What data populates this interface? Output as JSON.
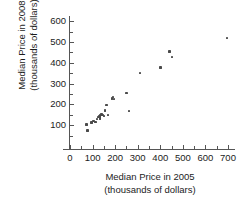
{
  "chart_data": {
    "type": "scatter",
    "title": "",
    "xlabel": "Median Price in 2005 (thousands of dollars)",
    "ylabel": "Median Price in 2008 (thousands of dollars)",
    "xlabel_line1": "Median Price in 2005",
    "xlabel_line2": "(thousands of dollars)",
    "ylabel_line1": "Median Price in 2008",
    "ylabel_line2": "(thousands of dollars)",
    "xlim": [
      0,
      720
    ],
    "ylim": [
      0,
      640
    ],
    "grid": false,
    "legend": null,
    "x_major_ticks": [
      0,
      100,
      200,
      300,
      400,
      500,
      600,
      700
    ],
    "x_tick_labels": [
      "0",
      "100",
      "200",
      "300",
      "400",
      "500",
      "600",
      "700"
    ],
    "x_minor_ticks": [
      50,
      150,
      250,
      350,
      450,
      550,
      650
    ],
    "y_major_ticks": [
      100,
      200,
      300,
      400,
      500,
      600
    ],
    "y_tick_labels": [
      "100",
      "200",
      "300",
      "400",
      "500",
      "600"
    ],
    "y_minor_ticks": [
      50,
      150,
      250,
      350,
      450,
      550
    ],
    "marker": "square",
    "marker_color": "#4a4a4a",
    "axis_color": "#555555",
    "points": [
      {
        "x": 72,
        "y": 103
      },
      {
        "x": 78,
        "y": 74
      },
      {
        "x": 96,
        "y": 112
      },
      {
        "x": 104,
        "y": 120
      },
      {
        "x": 112,
        "y": 115
      },
      {
        "x": 120,
        "y": 130
      },
      {
        "x": 126,
        "y": 140
      },
      {
        "x": 130,
        "y": 143
      },
      {
        "x": 132,
        "y": 150
      },
      {
        "x": 134,
        "y": 133
      },
      {
        "x": 140,
        "y": 152
      },
      {
        "x": 146,
        "y": 148
      },
      {
        "x": 150,
        "y": 145
      },
      {
        "x": 156,
        "y": 170
      },
      {
        "x": 162,
        "y": 198
      },
      {
        "x": 168,
        "y": 150
      },
      {
        "x": 186,
        "y": 228
      },
      {
        "x": 190,
        "y": 236
      },
      {
        "x": 196,
        "y": 225
      },
      {
        "x": 250,
        "y": 255
      },
      {
        "x": 262,
        "y": 168
      },
      {
        "x": 310,
        "y": 350
      },
      {
        "x": 402,
        "y": 377
      },
      {
        "x": 440,
        "y": 455
      },
      {
        "x": 452,
        "y": 428
      },
      {
        "x": 695,
        "y": 520
      }
    ]
  }
}
